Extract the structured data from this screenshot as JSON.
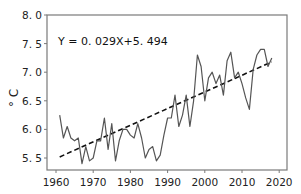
{
  "chart_data": {
    "type": "line",
    "title": "",
    "xlabel": "",
    "ylabel": "° C",
    "xlim": [
      1958,
      2022
    ],
    "ylim": [
      5.25,
      8.0
    ],
    "x_ticks": [
      1960,
      1970,
      1980,
      1990,
      2000,
      2010,
      2020
    ],
    "x_tick_labels": [
      "1960",
      "1970",
      "1980",
      "1990",
      "2000",
      "2010",
      "2020"
    ],
    "y_ticks": [
      5.5,
      6.0,
      6.5,
      7.0,
      7.5,
      8.0
    ],
    "y_tick_labels": [
      "5. 5",
      "6. 0",
      "6. 5",
      "7. 0",
      "7. 5",
      "8. 0"
    ],
    "grid": false,
    "legend": null,
    "annotations": [
      {
        "text": "Y = 0. 029X+5. 494",
        "position": "top-left"
      }
    ],
    "x": [
      1961,
      1962,
      1963,
      1964,
      1965,
      1966,
      1967,
      1968,
      1969,
      1970,
      1971,
      1972,
      1973,
      1974,
      1975,
      1976,
      1977,
      1978,
      1979,
      1980,
      1981,
      1982,
      1983,
      1984,
      1985,
      1986,
      1987,
      1988,
      1989,
      1990,
      1991,
      1992,
      1993,
      1994,
      1995,
      1996,
      1997,
      1998,
      1999,
      2000,
      2001,
      2002,
      2003,
      2004,
      2005,
      2006,
      2007,
      2008,
      2009,
      2010,
      2011,
      2012,
      2013,
      2014,
      2015,
      2016,
      2017,
      2018
    ],
    "series": [
      {
        "name": "Annual mean temperature",
        "style": "solid",
        "color": "#555555",
        "values": [
          6.25,
          5.85,
          6.05,
          5.85,
          5.8,
          5.85,
          5.4,
          5.7,
          5.45,
          5.5,
          5.8,
          5.8,
          6.2,
          5.65,
          6.1,
          5.45,
          5.8,
          6.0,
          6.0,
          5.9,
          5.85,
          6.1,
          5.85,
          5.5,
          5.65,
          5.7,
          5.45,
          5.55,
          5.9,
          6.2,
          6.2,
          6.6,
          6.05,
          6.25,
          6.6,
          6.05,
          6.5,
          7.3,
          7.1,
          6.5,
          6.9,
          7.0,
          6.8,
          6.95,
          6.6,
          7.2,
          7.35,
          6.9,
          7.0,
          6.8,
          6.55,
          6.35,
          7.05,
          7.3,
          7.4,
          7.4,
          7.1,
          7.25
        ]
      },
      {
        "name": "Linear trend",
        "style": "dashed",
        "color": "#111111",
        "slope": 0.029,
        "intercept": 5.494,
        "x_index_start": 1,
        "values_endpoints": [
          5.52,
          7.18
        ]
      }
    ]
  }
}
